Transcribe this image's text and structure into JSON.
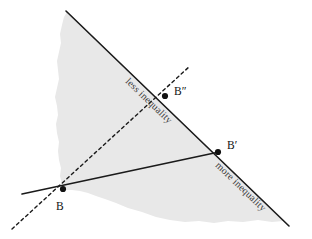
{
  "figure": {
    "type": "diagram",
    "background_color": "#ffffff",
    "region_fill_color": "#e8e8e8",
    "line_color": "#1a1a1a",
    "label_color": "#3a3a3a"
  },
  "labels": {
    "less_inequality": "less inequality",
    "more_inequality": "more inequality",
    "point_b": "B",
    "point_b_prime": "B′",
    "point_b_double_prime": "B″"
  },
  "points": [
    {
      "name": "B",
      "label": "B",
      "x": 63,
      "y": 189
    },
    {
      "name": "B'",
      "label": "B′",
      "x": 218,
      "y": 152
    },
    {
      "name": "B''",
      "label": "B″",
      "x": 165,
      "y": 96
    }
  ],
  "lines": {
    "frontier": {
      "name": "frontier-line",
      "style": "solid",
      "x1": 66,
      "y1": 11,
      "x2": 289,
      "y2": 226,
      "segments": [
        {
          "name": "less-inequality-segment",
          "label": "less inequality"
        },
        {
          "name": "more-inequality-segment",
          "label": "more inequality"
        }
      ]
    },
    "budget": {
      "name": "budget-line",
      "style": "solid",
      "x1": 22,
      "y1": 194,
      "x2": 219,
      "y2": 152
    },
    "ray": {
      "name": "dashed-ray",
      "style": "dashed",
      "x1": 12,
      "y1": 229,
      "x2": 190,
      "y2": 66
    }
  },
  "region": {
    "name": "feasible-set",
    "description": "shaded feasible region"
  }
}
